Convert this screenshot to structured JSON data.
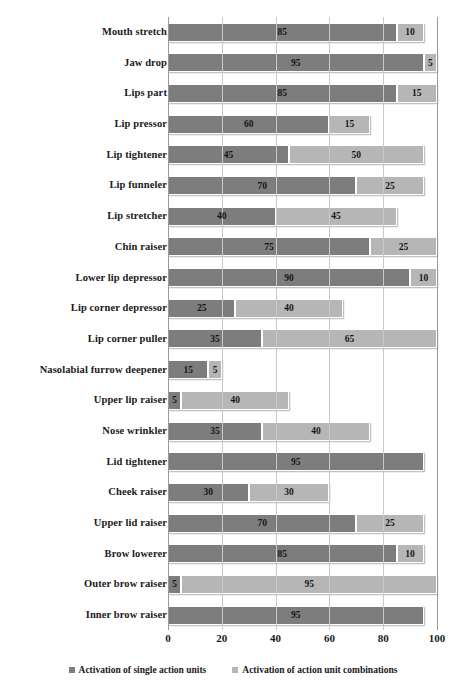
{
  "chart_data": {
    "type": "bar",
    "subtype": "stacked-horizontal",
    "title": "",
    "xlabel": "",
    "ylabel": "",
    "xlim": [
      0,
      100
    ],
    "xticks": [
      0,
      20,
      40,
      60,
      80,
      100
    ],
    "grid": true,
    "legend_position": "bottom",
    "categories": [
      "Mouth stretch",
      "Jaw drop",
      "Lips part",
      "Lip pressor",
      "Lip tightener",
      "Lip funneler",
      "Lip stretcher",
      "Chin raiser",
      "Lower lip depressor",
      "Lip corner depressor",
      "Lip corner puller",
      "Nasolabial furrow deepener",
      "Upper lip raiser",
      "Nose wrinkler",
      "Lid tightener",
      "Cheek raiser",
      "Upper lid raiser",
      "Brow lowerer",
      "Outer brow raiser",
      "Inner brow raiser"
    ],
    "series": [
      {
        "name": "Activation of single action units",
        "color": "#7d7d7d",
        "values": [
          85,
          95,
          85,
          60,
          45,
          70,
          40,
          75,
          90,
          25,
          35,
          15,
          5,
          35,
          95,
          30,
          70,
          85,
          5,
          95
        ]
      },
      {
        "name": "Activation of action unit combinations",
        "color": "#b6b6b6",
        "values": [
          10,
          5,
          15,
          15,
          50,
          25,
          45,
          25,
          10,
          40,
          65,
          5,
          40,
          40,
          0,
          30,
          25,
          10,
          95,
          0
        ]
      }
    ]
  },
  "axis": {
    "tick_labels": [
      "0",
      "20",
      "40",
      "60",
      "80",
      "100"
    ]
  },
  "legend": {
    "items": [
      {
        "label": "Activation of single action units",
        "swatch": "dark"
      },
      {
        "label": "Activation of action unit combinations",
        "swatch": "light"
      }
    ]
  },
  "colors": {
    "single_action_units": "#7d7d7d",
    "action_unit_combinations": "#b6b6b6",
    "gridline": "#c9c9c9",
    "axis": "#9a9a9a",
    "background": "#ffffff",
    "text": "#1a1a1a"
  }
}
